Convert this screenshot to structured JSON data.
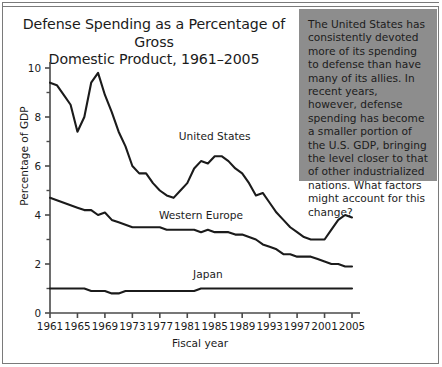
{
  "chart_data": {
    "type": "line",
    "title": "Defense Spending as a Percentage of Gross Domestic Product, 1961–2005",
    "title_line1": "Defense Spending as a Percentage of Gross",
    "title_line2": "Domestic Product, 1961–2005",
    "xlabel": "Fiscal year",
    "ylabel": "Percentage of GDP",
    "xlim": [
      1961,
      2005
    ],
    "ylim": [
      0,
      10
    ],
    "grid": false,
    "legend_position": "inline-labels",
    "y_ticks": [
      0,
      2,
      4,
      6,
      8,
      10
    ],
    "y_tick_labels": [
      "0",
      "2",
      "4",
      "6",
      "8",
      "10"
    ],
    "y_minor_ticks": [
      1,
      3,
      5,
      7,
      9
    ],
    "x_ticks": [
      1961,
      1965,
      1969,
      1973,
      1977,
      1981,
      1985,
      1989,
      1993,
      1997,
      2001,
      2005
    ],
    "x_tick_labels": [
      "1961",
      "1965",
      "1969",
      "1973",
      "1977",
      "1981",
      "1985",
      "1989",
      "1993",
      "1997",
      "2001",
      "2005"
    ],
    "x": [
      1961,
      1962,
      1963,
      1964,
      1965,
      1966,
      1967,
      1968,
      1969,
      1970,
      1971,
      1972,
      1973,
      1974,
      1975,
      1976,
      1977,
      1978,
      1979,
      1980,
      1981,
      1982,
      1983,
      1984,
      1985,
      1986,
      1987,
      1988,
      1989,
      1990,
      1991,
      1992,
      1993,
      1994,
      1995,
      1996,
      1997,
      1998,
      1999,
      2000,
      2001,
      2002,
      2003,
      2004,
      2005
    ],
    "series": [
      {
        "name": "United States",
        "color": "#1b1b1b",
        "values": [
          9.4,
          9.3,
          8.9,
          8.5,
          7.4,
          8.0,
          9.4,
          9.8,
          8.9,
          8.2,
          7.4,
          6.8,
          6.0,
          5.7,
          5.7,
          5.3,
          5.0,
          4.8,
          4.7,
          5.0,
          5.3,
          5.9,
          6.2,
          6.1,
          6.4,
          6.4,
          6.2,
          5.9,
          5.7,
          5.3,
          4.8,
          4.9,
          4.5,
          4.1,
          3.8,
          3.5,
          3.3,
          3.1,
          3.0,
          3.0,
          3.0,
          3.4,
          3.8,
          4.0,
          3.9
        ],
        "label_x": 1985,
        "label_text": "United States"
      },
      {
        "name": "Western Europe",
        "color": "#1b1b1b",
        "values": [
          4.7,
          4.6,
          4.5,
          4.4,
          4.3,
          4.2,
          4.2,
          4.0,
          4.1,
          3.8,
          3.7,
          3.6,
          3.5,
          3.5,
          3.5,
          3.5,
          3.5,
          3.4,
          3.4,
          3.4,
          3.4,
          3.4,
          3.3,
          3.4,
          3.3,
          3.3,
          3.3,
          3.2,
          3.2,
          3.1,
          3.0,
          2.8,
          2.7,
          2.6,
          2.4,
          2.4,
          2.3,
          2.3,
          2.3,
          2.2,
          2.1,
          2.0,
          2.0,
          1.9,
          1.9
        ],
        "label_x": 1983,
        "label_text": "Western Europe"
      },
      {
        "name": "Japan",
        "color": "#1b1b1b",
        "values": [
          1.0,
          1.0,
          1.0,
          1.0,
          1.0,
          1.0,
          0.9,
          0.9,
          0.9,
          0.8,
          0.8,
          0.9,
          0.9,
          0.9,
          0.9,
          0.9,
          0.9,
          0.9,
          0.9,
          0.9,
          0.9,
          0.9,
          1.0,
          1.0,
          1.0,
          1.0,
          1.0,
          1.0,
          1.0,
          1.0,
          1.0,
          1.0,
          1.0,
          1.0,
          1.0,
          1.0,
          1.0,
          1.0,
          1.0,
          1.0,
          1.0,
          1.0,
          1.0,
          1.0,
          1.0
        ],
        "label_x": 1984,
        "label_text": "Japan"
      }
    ]
  },
  "callout": {
    "text": "The United States has consistently devoted more of its spending to defense than have many of its allies. In recent years, however, defense spending has become a smaller portion of the U.S. GDP, bringing the level closer to that of other industrialized nations. What factors might account for this change?",
    "background_color": "#8d8d8d"
  },
  "colors": {
    "line": "#1b1b1b",
    "axis": "#4a4a4a",
    "frame": "#7a7a7a",
    "text": "#1b1b1b",
    "background": "#ffffff"
  }
}
